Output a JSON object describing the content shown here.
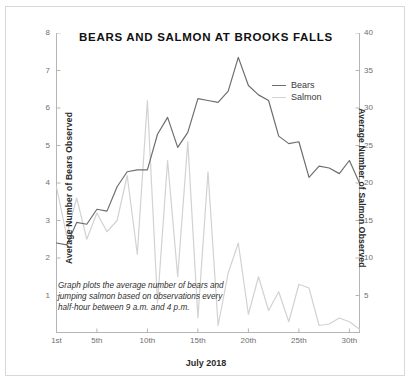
{
  "chart_data": {
    "type": "line",
    "title": "BEARS AND SALMON AT BROOKS FALLS",
    "xlabel": "July 2018",
    "ylabel": "Average Number of Bears Observed",
    "ylabel_right": "Average Number of Salmon Observed",
    "annotation": "Graph plots the average number of bears and jumping salmon based on observations every half-hour between 9 a.m. and 4 p.m.",
    "grid": false,
    "legend_position": "top-right",
    "x": [
      1,
      2,
      3,
      4,
      5,
      6,
      7,
      8,
      9,
      10,
      11,
      12,
      13,
      14,
      15,
      16,
      17,
      18,
      19,
      20,
      21,
      22,
      23,
      24,
      25,
      26,
      27,
      28,
      29,
      30,
      31
    ],
    "xtick_values": [
      1,
      5,
      10,
      15,
      20,
      25,
      30
    ],
    "xtick_labels": [
      "1st",
      "5th",
      "10th",
      "15th",
      "20th",
      "25th",
      "30th"
    ],
    "ylim": [
      0,
      8
    ],
    "ytick_values": [
      1,
      2,
      3,
      4,
      5,
      6,
      7,
      8
    ],
    "ytick_labels": [
      "1",
      "2",
      "3",
      "4",
      "5",
      "6",
      "7",
      "8"
    ],
    "ylim_right": [
      0,
      40
    ],
    "ytick_values_right": [
      5,
      10,
      15,
      20,
      25,
      30,
      35,
      40
    ],
    "ytick_labels_right": [
      "5",
      "10",
      "15",
      "20",
      "25",
      "30",
      "35",
      "40"
    ],
    "series": [
      {
        "name": "Bears",
        "axis": "left",
        "color": "#6e6e6e",
        "values": [
          2.4,
          2.35,
          2.95,
          2.9,
          3.3,
          3.25,
          3.9,
          4.3,
          4.35,
          4.35,
          5.3,
          5.75,
          4.95,
          5.35,
          6.25,
          6.2,
          6.15,
          6.45,
          7.35,
          6.6,
          6.35,
          6.2,
          5.25,
          5.05,
          5.1,
          4.15,
          4.45,
          4.4,
          4.25,
          4.6,
          4.0
        ]
      },
      {
        "name": "Salmon",
        "axis": "right",
        "color": "#d2d2d2",
        "values": [
          19.5,
          13.0,
          18.0,
          12.5,
          16.0,
          13.5,
          15.0,
          21.0,
          10.5,
          31.0,
          4.0,
          23.0,
          7.5,
          25.5,
          2.0,
          21.5,
          1.0,
          8.0,
          12.0,
          2.5,
          7.5,
          3.0,
          5.5,
          1.5,
          6.5,
          6.0,
          1.0,
          1.2,
          2.0,
          1.5,
          0.5
        ]
      }
    ]
  },
  "legend": {
    "items": [
      {
        "label": "Bears",
        "color": "#6e6e6e"
      },
      {
        "label": "Salmon",
        "color": "#d2d2d2"
      }
    ]
  }
}
